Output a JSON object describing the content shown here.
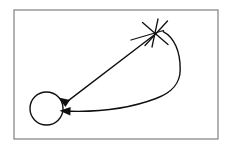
{
  "figure": {
    "background_color": "#ffffff",
    "ink_color": "#101010",
    "width": 234,
    "height": 151
  },
  "frame": {
    "name": "border-rectangle",
    "stroke_color": "#808080",
    "stroke_width": 1.2,
    "x": 14,
    "y": 10,
    "width": 204,
    "height": 129
  },
  "nodes": [
    {
      "id": "circle-node",
      "label": "circle",
      "shape": "circle",
      "cx": 46.5,
      "cy": 108.5,
      "r": 16.5,
      "stroke_width": 1.4
    },
    {
      "id": "star-node",
      "label": "star",
      "shape": "asterisk",
      "cx": 155,
      "cy": 33,
      "stroke_width": 1.3,
      "strokes": [
        {
          "x1": 142.5,
          "y1": 22.5,
          "x2": 168.0,
          "y2": 44.5
        },
        {
          "x1": 167.5,
          "y1": 21.0,
          "x2": 145.0,
          "y2": 45.5
        },
        {
          "x1": 158.0,
          "y1": 19.0,
          "x2": 152.0,
          "y2": 47.0
        },
        {
          "x1": 131.0,
          "y1": 40.0,
          "x2": 163.5,
          "y2": 30.5
        }
      ]
    }
  ],
  "edges": [
    {
      "id": "straight-arrow",
      "label": "straight arrow from star to circle",
      "type": "line",
      "stroke_width": 1.4,
      "from": {
        "x": 155.5,
        "y": 34.0
      },
      "to": {
        "x": 60.0,
        "y": 96.5
      },
      "arrowhead": {
        "tip_x": 58.5,
        "tip_y": 97.5,
        "angle_deg": 213,
        "length": 11,
        "half_width": 4.2
      }
    },
    {
      "id": "curved-arrow",
      "label": "curved arrow from star looping right then to circle",
      "type": "bezier",
      "stroke_width": 1.4,
      "path": "M 163.2 31.6 C 174.5 37.5 180.5 52.0 180.2 70.0 C 180.0 84.0 172.0 92.5 156.0 98.5 C 128.0 109.0 95.0 112.5 63.5 111.0",
      "arrowhead": {
        "tip_x": 59.5,
        "tip_y": 110.8,
        "angle_deg": 182,
        "length": 11,
        "half_width": 4.2
      }
    }
  ]
}
